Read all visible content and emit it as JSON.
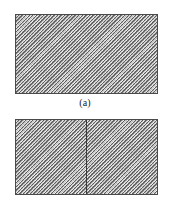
{
  "figure": {
    "type": "technical-diagram",
    "background_color": "#ffffff",
    "border_color": "#4a4a4a",
    "fill_color": "#bdbdbd",
    "hatch": {
      "style": "diagonal-lines",
      "direction": "upper-left-to-lower-right",
      "angle_degrees": 45
    },
    "panels": [
      {
        "id": "a",
        "caption": "(a)",
        "shape": "rectangle",
        "subdivided": false,
        "divider_count": 0
      },
      {
        "id": "b",
        "caption": "(b)",
        "shape": "rectangle",
        "subdivided": true,
        "divider_count": 1,
        "divider_orientation": "vertical",
        "divider_position_percent": 50
      }
    ]
  }
}
